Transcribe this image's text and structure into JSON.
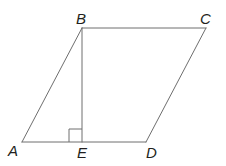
{
  "figure": {
    "kind": "parallelogram-with-altitude",
    "background_color": "#ffffff",
    "stroke_color": "#6e6e6e",
    "label_color": "#231f20",
    "stroke_width": 1,
    "points": {
      "A": {
        "x": 22,
        "y": 142
      },
      "B": {
        "x": 82,
        "y": 28
      },
      "C": {
        "x": 206,
        "y": 28
      },
      "D": {
        "x": 146,
        "y": 142
      },
      "E": {
        "x": 82,
        "y": 142
      }
    },
    "segments": [
      {
        "name": "AB",
        "from": "A",
        "to": "B"
      },
      {
        "name": "BC",
        "from": "B",
        "to": "C"
      },
      {
        "name": "CD",
        "from": "C",
        "to": "D"
      },
      {
        "name": "AD",
        "from": "A",
        "to": "D"
      },
      {
        "name": "BE",
        "from": "B",
        "to": "E"
      }
    ],
    "right_angle_marker": {
      "at": "E",
      "size": 13,
      "x": 69,
      "y": 129
    },
    "labels": {
      "A": "A",
      "B": "B",
      "C": "C",
      "D": "D",
      "E": "E"
    },
    "label_positions": {
      "A": {
        "left": 8,
        "top": 143
      },
      "B": {
        "left": 76,
        "top": 11
      },
      "C": {
        "left": 200,
        "top": 11
      },
      "D": {
        "left": 146,
        "top": 145
      },
      "E": {
        "left": 77,
        "top": 145
      }
    }
  }
}
